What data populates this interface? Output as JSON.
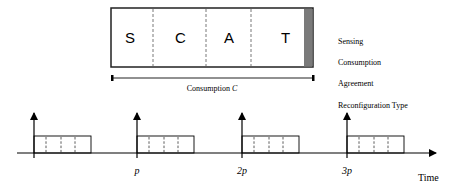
{
  "frame": {
    "segments": [
      {
        "letter": "S",
        "x": 111,
        "w": 42
      },
      {
        "letter": "C",
        "x": 153,
        "w": 53
      },
      {
        "letter": "A",
        "x": 206,
        "w": 45
      },
      {
        "letter": "T",
        "x": 251,
        "w": 53
      }
    ],
    "tail_color": "#7a7a7a",
    "span_label": "Consumption",
    "span_label_var": "C"
  },
  "legend": {
    "items": [
      "Sensing",
      "Consumption",
      "Agreement",
      "Reconfiguration Type"
    ]
  },
  "timeline": {
    "axis_label": "Time",
    "ticks": [
      {
        "label": "",
        "x": 34
      },
      {
        "label": "p",
        "x": 137
      },
      {
        "label": "2p",
        "x": 242
      },
      {
        "label": "3p",
        "x": 347
      }
    ]
  }
}
